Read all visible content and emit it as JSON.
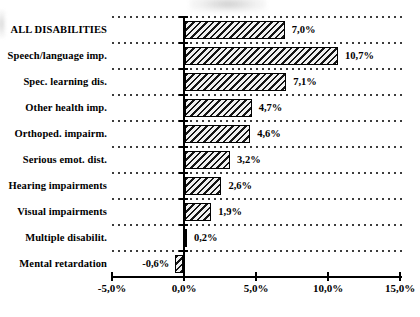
{
  "chart_data": {
    "type": "bar",
    "orientation": "horizontal",
    "title": "",
    "categories": [
      "ALL DISABILITIES",
      "Speech/language imp.",
      "Spec. learning dis.",
      "Other health imp.",
      "Orthoped. impairm.",
      "Serious emot. dist.",
      "Hearing impairments",
      "Visual impairments",
      "Multiple disabilit.",
      "Mental retardation"
    ],
    "values": [
      7.0,
      10.7,
      7.1,
      4.7,
      4.6,
      3.2,
      2.6,
      1.9,
      0.2,
      -0.6
    ],
    "value_labels": [
      "7,0%",
      "10,7%",
      "7,1%",
      "4,7%",
      "4,6%",
      "3,2%",
      "2,6%",
      "1,9%",
      "0,2%",
      "-0,6%"
    ],
    "xlim": [
      -5,
      15
    ],
    "x_ticks": [
      -5,
      0,
      5,
      10,
      15
    ],
    "x_tick_labels": [
      "-5,0%",
      "0,0%",
      "5,0%",
      "10,0%",
      "15,0%"
    ],
    "grid": "horizontal-dotted",
    "legend": "none",
    "bar_style": "diagonal-hatch",
    "colors": {
      "background": "#ffffff",
      "text": "#000000",
      "bar_hatch": "#161616",
      "bar_bg": "#f2f2f2",
      "bar_border": "#000000",
      "grid": "#3c3c3c",
      "axis": "#000000"
    }
  }
}
